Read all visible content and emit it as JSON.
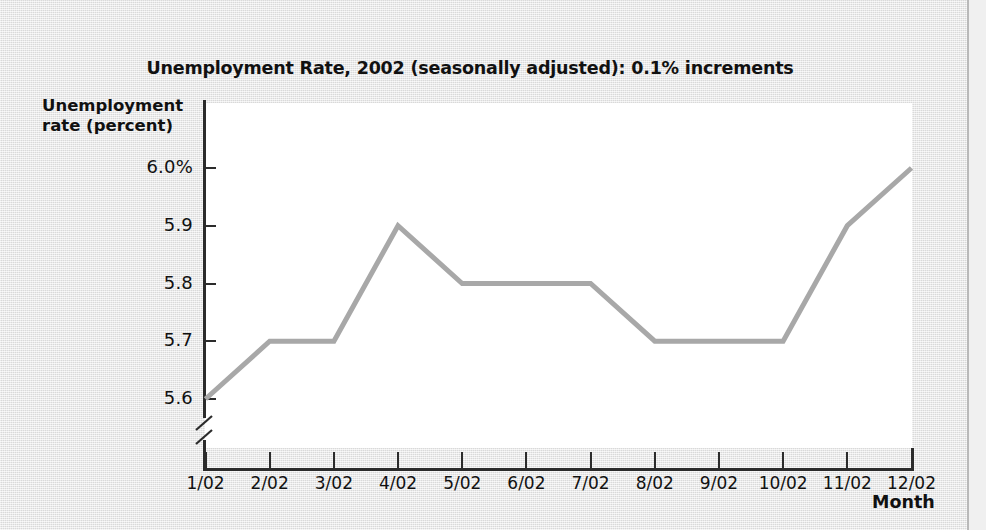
{
  "chart_data": {
    "type": "line",
    "title": "Unemployment Rate, 2002 (seasonally adjusted): 0.1% increments",
    "xlabel": "Month",
    "ylabel_line1": "Unemployment",
    "ylabel_line2": "rate (percent)",
    "categories": [
      "1/02",
      "2/02",
      "3/02",
      "4/02",
      "5/02",
      "6/02",
      "7/02",
      "8/02",
      "9/02",
      "10/02",
      "11/02",
      "12/02"
    ],
    "values": [
      5.6,
      5.7,
      5.7,
      5.9,
      5.8,
      5.8,
      5.8,
      5.7,
      5.7,
      5.7,
      5.9,
      6.0
    ],
    "ytick_labels": [
      "6.0%",
      "5.9",
      "5.8",
      "5.7",
      "5.6"
    ],
    "ytick_values": [
      6.0,
      5.9,
      5.8,
      5.7,
      5.6
    ],
    "ylim": [
      5.6,
      6.0
    ],
    "y_axis_broken": true,
    "grid": false,
    "legend": "none",
    "series_color": "#a8a8a8",
    "axis_color": "#2b2b2b",
    "plot_background": "#ffffff",
    "page_background": "#e8e8e8"
  }
}
